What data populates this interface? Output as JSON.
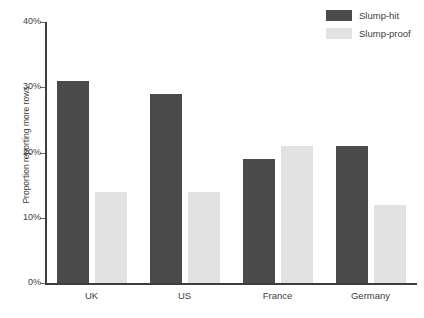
{
  "chart_data": {
    "type": "bar",
    "title": "",
    "subtitle": "",
    "xlabel": "",
    "ylabel": "Proportion reporting more rows",
    "categories": [
      "UK",
      "US",
      "France",
      "Germany"
    ],
    "series": [
      {
        "name": "Slump-hit",
        "color": "#4a4a4a",
        "values": [
          31,
          29,
          19,
          21
        ]
      },
      {
        "name": "Slump-proof",
        "color": "#e2e2e2",
        "values": [
          14,
          14,
          21,
          12
        ]
      }
    ],
    "ylim": [
      0,
      40
    ],
    "ytick_values": [
      0,
      10,
      20,
      30,
      40
    ],
    "ytick_labels": [
      "0%",
      "10%",
      "20%",
      "30%",
      "40%"
    ],
    "grid": false,
    "legend_position": "top-right",
    "value_unit": "%"
  },
  "legend": {
    "items": [
      {
        "label": "Slump-hit",
        "color": "#4a4a4a"
      },
      {
        "label": "Slump-proof",
        "color": "#e2e2e2"
      }
    ]
  },
  "axes": {
    "y_title": "Proportion reporting more rows",
    "y_ticks": [
      "40%",
      "30%",
      "20%",
      "10%",
      "0%"
    ],
    "x_labels": [
      "UK",
      "US",
      "France",
      "Germany"
    ]
  },
  "footer": {
    "note": ""
  }
}
